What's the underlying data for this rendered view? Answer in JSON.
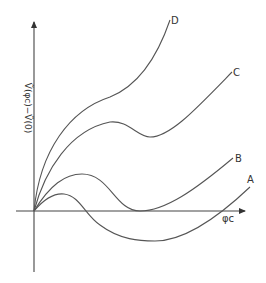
{
  "diagram": {
    "axes": {
      "x_label": "φc",
      "y_label": "Ṽ(φc)−Ṽ(0)"
    },
    "curves": [
      {
        "id": "A",
        "label": "A",
        "description": "small hump, dips below zero, crosses axis again and rises"
      },
      {
        "id": "B",
        "label": "B",
        "description": "hump, touches zero at a minimum, then rises"
      },
      {
        "id": "C",
        "label": "C",
        "description": "rises, local max, shallow local min above zero, then rises"
      },
      {
        "id": "D",
        "label": "D",
        "description": "monotonically increasing"
      }
    ],
    "colors": {
      "line": "#555555",
      "axis": "#444444",
      "background": "#ffffff"
    }
  }
}
